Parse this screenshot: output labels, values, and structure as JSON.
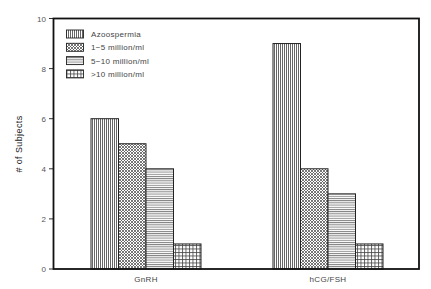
{
  "chart_data": {
    "type": "bar",
    "title": "",
    "xlabel": "",
    "ylabel": "# of Subjects",
    "ylim": [
      0,
      10
    ],
    "yticks": [
      0,
      2,
      4,
      6,
      8,
      10
    ],
    "grid": false,
    "legend_position": "upper left (inside)",
    "categories": [
      "GnRH",
      "hCG/FSH"
    ],
    "series": [
      {
        "name": "Azoospermia",
        "pattern": "vertical-lines",
        "values": [
          6,
          9
        ]
      },
      {
        "name": "1-5  million/ml",
        "pattern": "crosshatch-dense",
        "values": [
          5,
          4
        ]
      },
      {
        "name": "5-10  million/ml",
        "pattern": "horizontal-lines",
        "values": [
          4,
          3
        ]
      },
      {
        "name": ">10  million/ml",
        "pattern": "grid",
        "values": [
          1,
          1
        ]
      }
    ]
  },
  "labels": {
    "ylabel": "# of Subjects",
    "categories": [
      "GnRH",
      "hCG/FSH"
    ],
    "yticks": [
      "0",
      "2",
      "4",
      "6",
      "8",
      "10"
    ],
    "legend": [
      "Azoospermia",
      "1−5  million/ml",
      "5−10  million/ml",
      ">10  million/ml"
    ]
  },
  "colors": {
    "frame": "#111111",
    "bar_outline": "#222222",
    "pattern_line": "#555555",
    "background": "#ffffff"
  }
}
